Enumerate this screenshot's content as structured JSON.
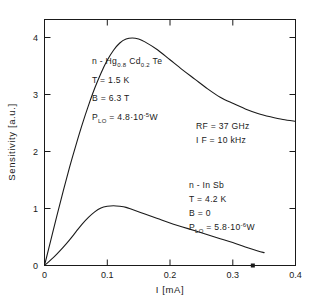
{
  "chart_data": {
    "type": "line",
    "title": "",
    "xlabel": "I [mA]",
    "ylabel": "Sensitivity [a.u.]",
    "xlim": [
      0,
      0.4
    ],
    "ylim": [
      0,
      4.4
    ],
    "xticks": [
      "0",
      "0.1",
      "0.2",
      "0.3",
      "0.4"
    ],
    "xtick_values": [
      0,
      0.1,
      0.2,
      0.3,
      0.4
    ],
    "yticks": [
      "0",
      "1",
      "2",
      "3",
      "4"
    ],
    "ytick_values": [
      0,
      1,
      2,
      3,
      4
    ],
    "grid": false,
    "legend": "none",
    "series": [
      {
        "name": "n - Hg0.8Cd0.2Te",
        "x": [
          0,
          0.01,
          0.02,
          0.03,
          0.04,
          0.05,
          0.06,
          0.07,
          0.08,
          0.09,
          0.1,
          0.11,
          0.12,
          0.13,
          0.14,
          0.15,
          0.16,
          0.18,
          0.2,
          0.22,
          0.24,
          0.26,
          0.28,
          0.3,
          0.32,
          0.34,
          0.36,
          0.38,
          0.4
        ],
        "y": [
          0.0,
          0.45,
          0.9,
          1.34,
          1.76,
          2.15,
          2.52,
          2.86,
          3.17,
          3.44,
          3.67,
          3.85,
          3.98,
          4.05,
          4.07,
          4.05,
          4.0,
          3.86,
          3.68,
          3.5,
          3.33,
          3.16,
          3.01,
          2.9,
          2.8,
          2.72,
          2.66,
          2.61,
          2.58
        ]
      },
      {
        "name": "n - In Sb",
        "x": [
          0,
          0.01,
          0.02,
          0.03,
          0.04,
          0.05,
          0.06,
          0.07,
          0.08,
          0.09,
          0.1,
          0.11,
          0.12,
          0.13,
          0.14,
          0.16,
          0.18,
          0.2,
          0.22,
          0.24,
          0.26,
          0.28,
          0.3,
          0.32,
          0.34,
          0.35
        ],
        "y": [
          0.0,
          0.1,
          0.21,
          0.33,
          0.46,
          0.6,
          0.74,
          0.86,
          0.96,
          1.03,
          1.06,
          1.07,
          1.06,
          1.04,
          1.0,
          0.92,
          0.84,
          0.76,
          0.69,
          0.62,
          0.55,
          0.48,
          0.41,
          0.33,
          0.26,
          0.23
        ]
      }
    ],
    "markers": [
      {
        "name": "axis-dot",
        "x": 0.332,
        "y": 0.0
      }
    ]
  },
  "annotations": {
    "upper": {
      "material_prefix": "n - Hg",
      "material_sub1": "0.8",
      "material_mid": "Cd",
      "material_sub2": "0.2",
      "material_suffix": "Te",
      "temperature": "T = 1.5 K",
      "field": "B = 6.3 T",
      "power_symbol": "P",
      "power_sub": "LO",
      "power_eq": " = 4.8",
      "power_mult": "·10",
      "power_exp": "-5",
      "power_unit": "W"
    },
    "lower": {
      "material": "n - In Sb",
      "temperature": "T = 4.2 K",
      "field": "B = 0",
      "power_symbol": "P",
      "power_sub": "LO",
      "power_eq": " = 5.8",
      "power_mult": "·10",
      "power_exp": "-6",
      "power_unit": "W"
    },
    "instrument": {
      "rf": "RF = 37 GHz",
      "if": "I F = 10 kHz"
    }
  },
  "colors": {
    "ink": "#1a1a1a",
    "background": "#ffffff"
  }
}
